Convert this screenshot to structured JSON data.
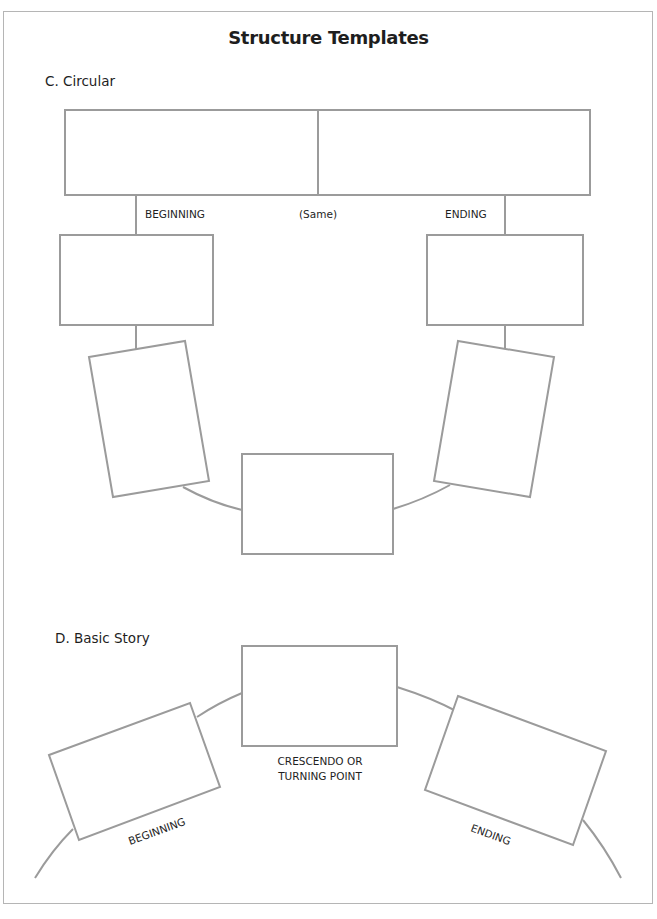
{
  "page": {
    "title": "Structure Templates"
  },
  "sections": {
    "circular": {
      "heading": "C.  Circular",
      "labels": {
        "beginning": "BEGINNING",
        "same": "(Same)",
        "ending": "ENDING"
      },
      "boxes": [
        {
          "id": "top-left-half",
          "text": ""
        },
        {
          "id": "top-right-half",
          "text": ""
        },
        {
          "id": "beginning-box",
          "text": ""
        },
        {
          "id": "ending-box",
          "text": ""
        },
        {
          "id": "left-tilted-box",
          "text": ""
        },
        {
          "id": "right-tilted-box",
          "text": ""
        },
        {
          "id": "bottom-center-box",
          "text": ""
        }
      ]
    },
    "basic_story": {
      "heading": "D.  Basic Story",
      "labels": {
        "crescendo_line1": "CRESCENDO OR",
        "crescendo_line2": "TURNING POINT",
        "beginning": "BEGINNING",
        "ending": "ENDING"
      },
      "boxes": [
        {
          "id": "beginning-box",
          "text": ""
        },
        {
          "id": "crescendo-box",
          "text": ""
        },
        {
          "id": "ending-box",
          "text": ""
        }
      ]
    }
  },
  "colors": {
    "stroke": "#9b9b9b",
    "text": "#1e1e1e",
    "background": "#ffffff"
  }
}
